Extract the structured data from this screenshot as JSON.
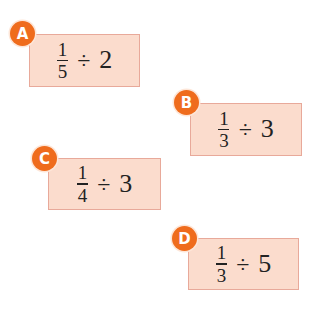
{
  "colors": {
    "card_fill": "#fbdccd",
    "card_border": "#e8a99a",
    "badge_fill": "#ef6c1d",
    "badge_text": "#ffffff",
    "text": "#222222"
  },
  "problems": [
    {
      "label": "A",
      "numerator": "1",
      "denominator": "5",
      "operator": "÷",
      "divisor": "2"
    },
    {
      "label": "B",
      "numerator": "1",
      "denominator": "3",
      "operator": "÷",
      "divisor": "3"
    },
    {
      "label": "C",
      "numerator": "1",
      "denominator": "4",
      "operator": "÷",
      "divisor": "3"
    },
    {
      "label": "D",
      "numerator": "1",
      "denominator": "3",
      "operator": "÷",
      "divisor": "5"
    }
  ]
}
